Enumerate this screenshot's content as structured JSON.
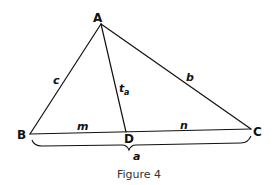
{
  "figure": {
    "caption": "Figure 4",
    "vertices": {
      "A": {
        "label": "A",
        "x": 101,
        "y": 24
      },
      "B": {
        "label": "B",
        "x": 30,
        "y": 134
      },
      "C": {
        "label": "C",
        "x": 251,
        "y": 129
      },
      "D": {
        "label": "D",
        "x": 126,
        "y": 132
      }
    },
    "side_labels": {
      "c": "c",
      "b": "b",
      "t_a_main": "t",
      "t_a_sub": "a",
      "m": "m",
      "n": "n",
      "a": "a"
    },
    "colors": {
      "stroke": "#111111",
      "caption": "#333333",
      "background": "#ffffff"
    }
  }
}
